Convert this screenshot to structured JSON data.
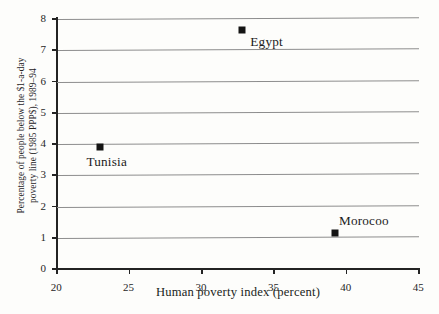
{
  "chart_data": {
    "type": "scatter",
    "title": "",
    "xlabel": "Human poverty index (percent)",
    "ylabel_line1": "Percentage of people below the $1-a-day",
    "ylabel_line2": "poverty line (1985 PPP$), 1989–94",
    "xlim": [
      20,
      45
    ],
    "ylim": [
      0,
      8
    ],
    "xticks": [
      "20",
      "25",
      "30",
      "35",
      "40",
      "45"
    ],
    "xtick_values": [
      20,
      25,
      30,
      35,
      40,
      45
    ],
    "yticks": [
      "0",
      "1",
      "2",
      "3",
      "4",
      "5",
      "6",
      "7",
      "8"
    ],
    "ytick_values": [
      0,
      1,
      2,
      3,
      4,
      5,
      6,
      7,
      8
    ],
    "grid": "horizontal",
    "legend": "none",
    "marker": "filled-square",
    "points": [
      {
        "label": "Egypt",
        "x": 32.8,
        "y": 7.65,
        "label_pos": "right-below"
      },
      {
        "label": "Tunisia",
        "x": 23.0,
        "y": 3.9,
        "label_pos": "below"
      },
      {
        "label": "Morocoo",
        "x": 39.2,
        "y": 1.15,
        "label_pos": "above-right"
      }
    ],
    "colors": {
      "marker": "#141414",
      "gridline": "#8d8d8d",
      "axis": "#232323",
      "background": "#fdfdfb",
      "text": "#1b1b1b"
    }
  }
}
